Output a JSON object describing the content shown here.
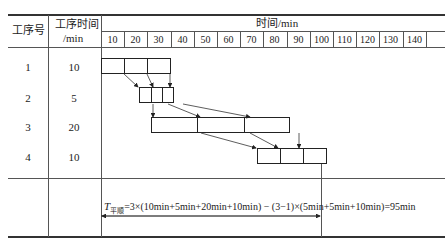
{
  "table": {
    "headers": {
      "process_no": "工序号",
      "process_time_line1": "工序时间",
      "process_time_line2": "/min",
      "time_axis": "时间/min"
    },
    "time_ticks": [
      "10",
      "20",
      "30",
      "40",
      "50",
      "60",
      "70",
      "80",
      "90",
      "100",
      "110",
      "120",
      "130",
      "140",
      ""
    ],
    "rows": [
      {
        "process_no": "1",
        "time": "10"
      },
      {
        "process_no": "2",
        "time": "5"
      },
      {
        "process_no": "3",
        "time": "20"
      },
      {
        "process_no": "4",
        "time": "10"
      }
    ]
  },
  "gantt": {
    "unit_px": 2.32,
    "bars": [
      {
        "process": 1,
        "start": 0,
        "duration": 10,
        "batches": 3
      },
      {
        "process": 2,
        "start": 16.4,
        "duration": 5,
        "batches": 3
      },
      {
        "process": 3,
        "start": 21.6,
        "duration": 20,
        "batches": 3
      },
      {
        "process": 4,
        "start": 67.2,
        "duration": 10,
        "batches": 3
      }
    ]
  },
  "formula": {
    "symbol": "T",
    "subscript": "平顺",
    "expression": "=3×(10min+5min+20min+10min) − (3−1)×(5min+5min+10min)=95min",
    "total": "95min"
  }
}
